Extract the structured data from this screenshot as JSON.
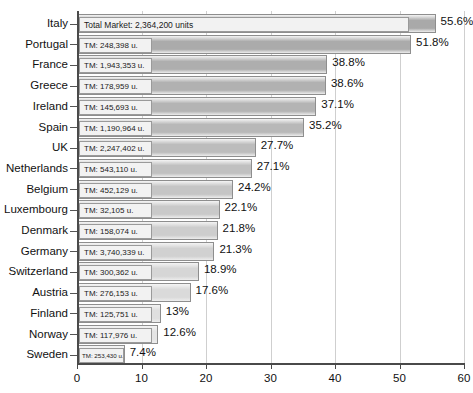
{
  "chart_data": {
    "type": "bar",
    "orientation": "horizontal",
    "title": "",
    "xlabel": "",
    "ylabel": "",
    "xlim": [
      0,
      60
    ],
    "xticks": [
      "0",
      "10",
      "20",
      "30",
      "40",
      "50",
      "60"
    ],
    "grid": true,
    "legend": null,
    "categories": [
      "Italy",
      "Portugal",
      "France",
      "Greece",
      "Ireland",
      "Spain",
      "UK",
      "Netherlands",
      "Belgium",
      "Luxembourg",
      "Denmark",
      "Germany",
      "Switzerland",
      "Austria",
      "Finland",
      "Norway",
      "Sweden"
    ],
    "values": [
      55.6,
      51.8,
      38.8,
      38.6,
      37.1,
      35.2,
      27.7,
      27.1,
      24.2,
      22.1,
      21.8,
      21.3,
      18.9,
      17.6,
      13,
      12.6,
      7.4
    ],
    "value_labels": [
      "55.6%",
      "51.8%",
      "38.8%",
      "38.6%",
      "37.1%",
      "35.2%",
      "27.7%",
      "27.1%",
      "24.2%",
      "22.1%",
      "21.8%",
      "21.3%",
      "18.9%",
      "17.6%",
      "13%",
      "12.6%",
      "7.4%"
    ],
    "bar_annotations": [
      "Total Market: 2,364,200 units",
      "TM: 248,398 u.",
      "TM: 1,943,353 u.",
      "TM: 178,959 u.",
      "TM: 145,693 u.",
      "TM: 1,190,964 u.",
      "TM: 2,247,402 u.",
      "TM: 543,110 u.",
      "TM: 452,129 u.",
      "TM: 32,105 u.",
      "TM: 158,074 u.",
      "TM: 3,740,339 u.",
      "TM: 300,362 u.",
      "TM: 276,153 u.",
      "TM: 125,751 u.",
      "TM: 117,976 u.",
      "TM: 253,430 u."
    ],
    "total_market_units": [
      2364200,
      248398,
      1943353,
      178959,
      145693,
      1190964,
      2247402,
      543110,
      452129,
      32105,
      158074,
      3740339,
      300362,
      276153,
      125751,
      117976,
      253430
    ],
    "bar_fill_colors": [
      "#a9a9a9",
      "#ababab",
      "#aeaeae",
      "#b1b1b1",
      "#b4b4b4",
      "#b8b8b8",
      "#bcbcbc",
      "#c0c0c0",
      "#c5c5c5",
      "#c9c9c9",
      "#cdcdcd",
      "#d1d1d1",
      "#d6d6d6",
      "#dadada",
      "#dfdfdf",
      "#e4e4e4",
      "#ebebeb"
    ],
    "colors": {
      "bar_border": "#8e8e8e",
      "gridline": "#cfcfcf",
      "axis": "#4a4a4a",
      "text": "#111111",
      "annotation_box_bg": "#f2f2f2",
      "background": "#ffffff"
    }
  }
}
